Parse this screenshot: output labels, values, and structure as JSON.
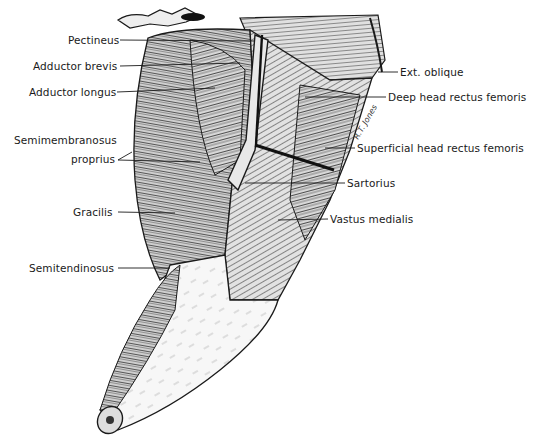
{
  "figure": {
    "labels_left": [
      {
        "id": "pectineus",
        "text": "Pectineus",
        "x": 68,
        "y": 56,
        "line_to": [
          255,
          41
        ]
      },
      {
        "id": "adductor-brevis",
        "text": "Adductor brevis",
        "x": 33,
        "y": 61,
        "line_to": [
          240,
          63
        ]
      },
      {
        "id": "adductor-longus",
        "text": "Adductor longus",
        "x": 29,
        "y": 87,
        "line_to": [
          215,
          88
        ]
      },
      {
        "id": "semimembranosus-proprius-1",
        "text": "Semimembranosus",
        "x": 14,
        "y": 140,
        "line_to": null
      },
      {
        "id": "semimembranosus-proprius-2",
        "text": "proprius",
        "x": 71,
        "y": 158,
        "line_to": [
          200,
          162
        ]
      },
      {
        "id": "gracilis",
        "text": "Gracilis",
        "x": 73,
        "y": 210,
        "line_to": [
          175,
          213
        ]
      },
      {
        "id": "semitendinosus",
        "text": "Semitendinosus",
        "x": 29,
        "y": 266,
        "line_to": [
          170,
          268
        ]
      }
    ],
    "labels_right": [
      {
        "id": "ext-oblique",
        "text": "Ext. oblique",
        "x": 400,
        "y": 70,
        "line_to": [
          380,
          72
        ]
      },
      {
        "id": "deep-head-rectus-femoris",
        "text": "Deep head rectus femoris",
        "x": 388,
        "y": 96,
        "line_to": [
          305,
          98
        ]
      },
      {
        "id": "superficial-head-rectus-femoris",
        "text": "Superficial head rectus femoris",
        "x": 357,
        "y": 146,
        "line_to": [
          325,
          148
        ]
      },
      {
        "id": "sartorius",
        "text": "Sartorius",
        "x": 347,
        "y": 182,
        "line_to": [
          245,
          182
        ]
      },
      {
        "id": "vastus-medialis",
        "text": "Vastus medialis",
        "x": 330,
        "y": 218,
        "line_to": [
          278,
          220
        ]
      }
    ],
    "signature": "R.T. Jones",
    "colors": {
      "ink": "#1a1a1a",
      "paper": "#ffffff",
      "shade_dark": "#3a3a3a",
      "shade_mid": "#8a8a8a",
      "skin": "#f4f4f4"
    }
  }
}
